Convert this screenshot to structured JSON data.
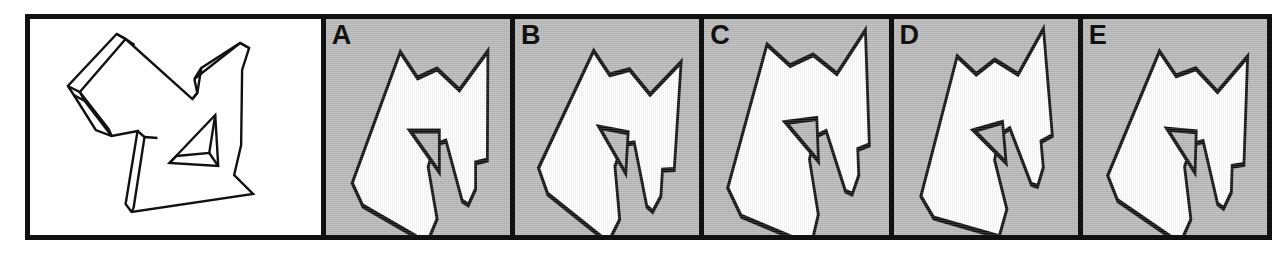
{
  "figure": {
    "type": "mental-rotation-test-item",
    "frame": {
      "border_color": "#111111",
      "border_width_px": 5,
      "x": 25,
      "y": 14,
      "width": 1247,
      "height": 226
    },
    "colors": {
      "ink": "#111111",
      "reference_background": "#ffffff",
      "option_background": "#b9b9b9",
      "shape_fill": "#ffffff",
      "hole_fill": "#b9b9b9"
    },
    "reference_panel": {
      "label": "",
      "background": "#ffffff",
      "style": "line-drawing",
      "note": "3D wireframe outline drawing of an angular object with a triangular through-hole"
    },
    "options": [
      {
        "label": "A",
        "background": "#b9b9b9",
        "rotation_note": "silhouette rotated, triangular hole opening toward upper-right",
        "outline": "133,33 47,164 66,187 181,224 199,200 183,148 194,126 215,122 244,182 255,186 268,170 268,144 289,141 290,32 239,71 199,50 164,59",
        "hole": "151,112 203,112 203,153"
      },
      {
        "label": "B",
        "background": "#b9b9b9",
        "rotation_note": "silhouette rotated slightly clockwise relative to A",
        "outline": "131,35 45,162 64,186 177,223 195,198 181,146 193,123 213,119 242,180 253,184 266,167 266,141 287,138 288,30 236,68 197,47 162,56",
        "hole": "149,110 201,110 201,151"
      },
      {
        "label": "C",
        "background": "#b9b9b9",
        "rotation_note": "silhouette enlarged / shifted, triangular hole near centre-right",
        "outline": "120,22 40,160 62,190 185,228 200,198 188,142 199,120 220,116 250,178 262,182 275,164 275,138 296,135 297,20 243,60 202,38 160,46",
        "hole": "148,102 204,102 204,145"
      },
      {
        "label": "D",
        "background": "#b9b9b9",
        "rotation_note": "silhouette rotated counter-clockwise, narrow lower lobe",
        "outline": "128,30 42,158 61,183 174,220 192,195 178,143 190,120 210,116 239,177 250,181 263,164 263,138 284,135 285,27 233,65 194,44 159,53",
        "hole": "146,108 198,108 198,149"
      },
      {
        "label": "E",
        "background": "#b9b9b9",
        "rotation_note": "silhouette rotated, right arm angled downward",
        "outline": "132,34 46,163 65,187 179,224 197,199 183,147 195,124 215,120 244,181 255,185 268,168 268,142 289,139 290,31 238,69 198,48 163,57",
        "hole": "150,111 202,111 202,152"
      }
    ]
  }
}
